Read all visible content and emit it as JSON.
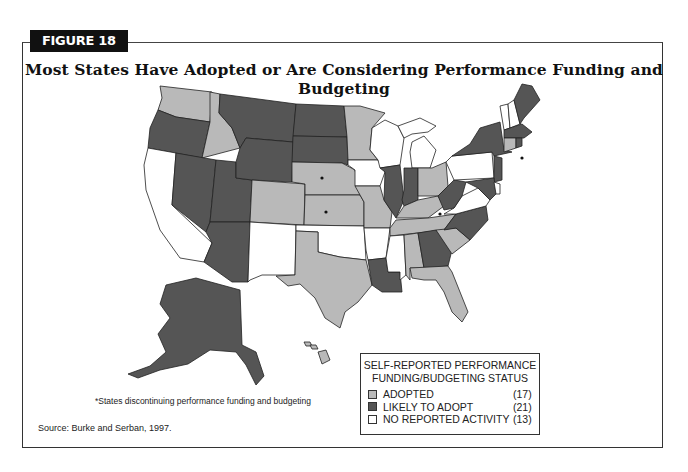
{
  "figure": {
    "label": "FIGURE 18",
    "title": "Most States Have Adopted or Are Considering Performance Funding and Budgeting"
  },
  "colors": {
    "adopted": "#b9b9b9",
    "likely_to_adopt": "#555555",
    "no_reported_activity": "#ffffff",
    "border": "#222222"
  },
  "legend": {
    "title_line1": "SELF-REPORTED PERFORMANCE",
    "title_line2": "FUNDING/BUDGETING STATUS",
    "items": [
      {
        "label": "ADOPTED",
        "count": "(17)",
        "status": "adopted"
      },
      {
        "label": "LIKELY TO ADOPT",
        "count": "(21)",
        "status": "likely_to_adopt"
      },
      {
        "label": "NO REPORTED ACTIVITY",
        "count": "(13)",
        "status": "no_reported_activity"
      }
    ]
  },
  "footnote": "*States discontinuing performance funding and budgeting",
  "source": "Source: Burke and Serban, 1997.",
  "map": {
    "states": [
      {
        "abbr": "WA",
        "status": "adopted"
      },
      {
        "abbr": "OR",
        "status": "likely_to_adopt"
      },
      {
        "abbr": "CA",
        "status": "no_reported_activity"
      },
      {
        "abbr": "ID",
        "status": "adopted"
      },
      {
        "abbr": "NV",
        "status": "likely_to_adopt"
      },
      {
        "abbr": "UT",
        "status": "likely_to_adopt"
      },
      {
        "abbr": "AZ",
        "status": "likely_to_adopt"
      },
      {
        "abbr": "MT",
        "status": "likely_to_adopt"
      },
      {
        "abbr": "WY",
        "status": "likely_to_adopt"
      },
      {
        "abbr": "CO",
        "status": "adopted"
      },
      {
        "abbr": "NM",
        "status": "no_reported_activity"
      },
      {
        "abbr": "ND",
        "status": "likely_to_adopt"
      },
      {
        "abbr": "SD",
        "status": "likely_to_adopt"
      },
      {
        "abbr": "NE",
        "status": "adopted",
        "discontinuing": true
      },
      {
        "abbr": "KS",
        "status": "adopted",
        "discontinuing": true
      },
      {
        "abbr": "OK",
        "status": "no_reported_activity"
      },
      {
        "abbr": "TX",
        "status": "adopted"
      },
      {
        "abbr": "MN",
        "status": "adopted"
      },
      {
        "abbr": "IA",
        "status": "no_reported_activity"
      },
      {
        "abbr": "MO",
        "status": "adopted"
      },
      {
        "abbr": "AR",
        "status": "no_reported_activity"
      },
      {
        "abbr": "LA",
        "status": "likely_to_adopt"
      },
      {
        "abbr": "WI",
        "status": "no_reported_activity"
      },
      {
        "abbr": "IL",
        "status": "likely_to_adopt"
      },
      {
        "abbr": "MI",
        "status": "no_reported_activity"
      },
      {
        "abbr": "IN",
        "status": "likely_to_adopt"
      },
      {
        "abbr": "OH",
        "status": "adopted"
      },
      {
        "abbr": "KY",
        "status": "adopted",
        "discontinuing": true
      },
      {
        "abbr": "TN",
        "status": "adopted"
      },
      {
        "abbr": "MS",
        "status": "no_reported_activity"
      },
      {
        "abbr": "AL",
        "status": "adopted"
      },
      {
        "abbr": "GA",
        "status": "likely_to_adopt"
      },
      {
        "abbr": "FL",
        "status": "adopted"
      },
      {
        "abbr": "SC",
        "status": "adopted"
      },
      {
        "abbr": "NC",
        "status": "likely_to_adopt"
      },
      {
        "abbr": "VA",
        "status": "no_reported_activity"
      },
      {
        "abbr": "WV",
        "status": "likely_to_adopt"
      },
      {
        "abbr": "PA",
        "status": "no_reported_activity"
      },
      {
        "abbr": "NY",
        "status": "likely_to_adopt"
      },
      {
        "abbr": "NJ",
        "status": "likely_to_adopt"
      },
      {
        "abbr": "MD",
        "status": "likely_to_adopt"
      },
      {
        "abbr": "DE",
        "status": "no_reported_activity"
      },
      {
        "abbr": "CT",
        "status": "adopted",
        "discontinuing": true
      },
      {
        "abbr": "RI",
        "status": "likely_to_adopt"
      },
      {
        "abbr": "MA",
        "status": "likely_to_adopt"
      },
      {
        "abbr": "VT",
        "status": "no_reported_activity"
      },
      {
        "abbr": "NH",
        "status": "no_reported_activity"
      },
      {
        "abbr": "ME",
        "status": "likely_to_adopt"
      },
      {
        "abbr": "AK",
        "status": "likely_to_adopt"
      },
      {
        "abbr": "HI",
        "status": "adopted"
      }
    ]
  }
}
